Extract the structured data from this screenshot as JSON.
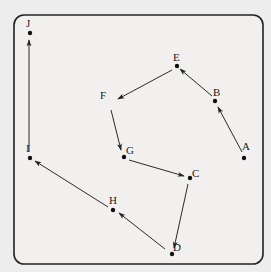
{
  "diagram": {
    "type": "directed-path",
    "nodes": [
      {
        "id": "A",
        "label": "A",
        "x": 244,
        "y": 158,
        "dot": true,
        "lx": 242,
        "ly": 150
      },
      {
        "id": "B",
        "label": "B",
        "x": 215,
        "y": 101,
        "dot": true,
        "lx": 213,
        "ly": 96
      },
      {
        "id": "E",
        "label": "E",
        "x": 177,
        "y": 66,
        "dot": true,
        "lx": 173,
        "ly": 61
      },
      {
        "id": "F",
        "label": "F",
        "x": 111,
        "y": 101,
        "dot": false,
        "lx": 100,
        "ly": 99
      },
      {
        "id": "G",
        "label": "G",
        "x": 124,
        "y": 157,
        "dot": true,
        "lx": 126,
        "ly": 154
      },
      {
        "id": "C",
        "label": "C",
        "x": 190,
        "y": 178,
        "dot": true,
        "lx": 192,
        "ly": 177
      },
      {
        "id": "D",
        "label": "D",
        "x": 172,
        "y": 254,
        "dot": true,
        "lx": 173,
        "ly": 251
      },
      {
        "id": "H",
        "label": "H",
        "x": 113,
        "y": 210,
        "dot": true,
        "lx": 109,
        "ly": 204
      },
      {
        "id": "I",
        "label": "I",
        "x": 30,
        "y": 158,
        "dot": true,
        "lx": 26,
        "ly": 152
      },
      {
        "id": "J",
        "label": "J",
        "x": 30,
        "y": 33,
        "dot": true,
        "lx": 26,
        "ly": 27
      }
    ],
    "edges": [
      {
        "from": "A",
        "to": "B",
        "x1": 242,
        "y1": 152,
        "x2": 218,
        "y2": 107
      },
      {
        "from": "B",
        "to": "E",
        "x1": 212,
        "y1": 96,
        "x2": 180,
        "y2": 69
      },
      {
        "from": "E",
        "to": "F",
        "x1": 172,
        "y1": 70,
        "x2": 118,
        "y2": 99
      },
      {
        "from": "F",
        "to": "G",
        "x1": 111,
        "y1": 110,
        "x2": 121,
        "y2": 150
      },
      {
        "from": "G",
        "to": "C",
        "x1": 129,
        "y1": 160,
        "x2": 184,
        "y2": 176
      },
      {
        "from": "C",
        "to": "D",
        "x1": 188,
        "y1": 184,
        "x2": 174,
        "y2": 248
      },
      {
        "from": "D",
        "to": "H",
        "x1": 165,
        "y1": 249,
        "x2": 119,
        "y2": 213
      },
      {
        "from": "H",
        "to": "I",
        "x1": 108,
        "y1": 207,
        "x2": 35,
        "y2": 161
      },
      {
        "from": "I",
        "to": "J",
        "x1": 29,
        "y1": 152,
        "x2": 29,
        "y2": 40
      }
    ],
    "frame": {
      "x": 14,
      "y": 15,
      "width": 249,
      "height": 249,
      "radius": 10
    }
  }
}
